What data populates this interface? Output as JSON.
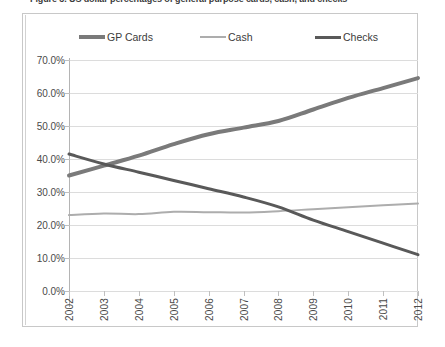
{
  "figure": {
    "title": "Figure 3. US dollar percentages of general purpose cards, cash, and checks"
  },
  "legend": {
    "position": "top",
    "items": [
      {
        "label": "GP Cards",
        "color": "#7a7a7a",
        "width": 4
      },
      {
        "label": "Cash",
        "color": "#adadad",
        "width": 2
      },
      {
        "label": "Checks",
        "color": "#595959",
        "width": 3
      }
    ]
  },
  "axes": {
    "y_ticks": [
      "0.0%",
      "10.0%",
      "20.0%",
      "30.0%",
      "40.0%",
      "50.0%",
      "60.0%",
      "70.0%"
    ],
    "x_ticks": [
      "2002",
      "2003",
      "2004",
      "2005",
      "2006",
      "2007",
      "2008",
      "2009",
      "2010",
      "2011",
      "2012"
    ]
  },
  "chart_data": {
    "type": "line",
    "title": "",
    "xlabel": "",
    "ylabel": "",
    "categories": [
      "2002",
      "2003",
      "2004",
      "2005",
      "2006",
      "2007",
      "2008",
      "2009",
      "2010",
      "2011",
      "2012"
    ],
    "x": [
      2002,
      2003,
      2004,
      2005,
      2006,
      2007,
      2008,
      2009,
      2010,
      2011,
      2012
    ],
    "series": [
      {
        "name": "GP Cards",
        "color": "#7a7a7a",
        "line_width": 4,
        "values": [
          35.0,
          38.0,
          41.0,
          44.5,
          47.5,
          49.5,
          51.5,
          55.0,
          58.5,
          61.5,
          64.5
        ]
      },
      {
        "name": "Cash",
        "color": "#adadad",
        "line_width": 2,
        "values": [
          23.0,
          23.5,
          23.3,
          24.0,
          23.9,
          23.8,
          24.2,
          24.8,
          25.4,
          26.0,
          26.5
        ]
      },
      {
        "name": "Checks",
        "color": "#595959",
        "line_width": 3,
        "values": [
          41.5,
          38.5,
          36.0,
          33.5,
          31.0,
          28.5,
          25.5,
          21.5,
          18.0,
          14.5,
          11.0
        ]
      }
    ],
    "ylim": [
      0,
      70
    ],
    "ytick_step": 10,
    "ytick_format": "percent",
    "grid": true,
    "grid_axis": "y",
    "legend_position": "top"
  }
}
